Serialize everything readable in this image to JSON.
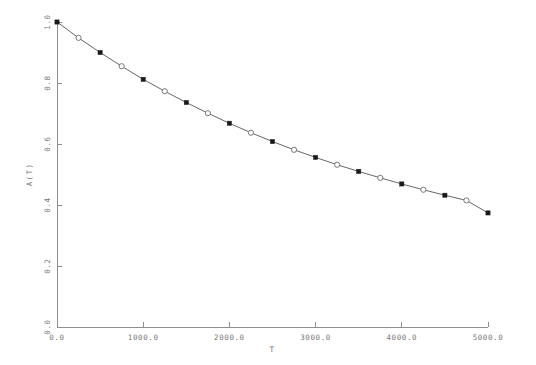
{
  "chart_data": {
    "type": "line",
    "title": "",
    "xlabel": "T",
    "ylabel": "A(T)",
    "xlim": [
      0.0,
      5000.0
    ],
    "ylim": [
      0.0,
      1.0
    ],
    "grid": false,
    "legend": null,
    "xticks": [
      0.0,
      1000.0,
      2000.0,
      3000.0,
      4000.0,
      5000.0
    ],
    "xticklabels": [
      "0.0",
      "1000.0",
      "2000.0",
      "3000.0",
      "4000.0",
      "5000.0"
    ],
    "yticks": [
      0.0,
      0.2,
      0.4,
      0.6,
      0.8,
      1.0
    ],
    "yticklabels": [
      "0.0",
      "0.2",
      "0.4",
      "0.6",
      "0.8",
      "1.0"
    ],
    "series": [
      {
        "name": "A(T)",
        "marker": "alternating-filled-square-open-circle",
        "line": "solid",
        "x": [
          0,
          250,
          500,
          750,
          1000,
          1250,
          1500,
          1750,
          2000,
          2250,
          2500,
          2750,
          3000,
          3250,
          3500,
          3750,
          4000,
          4250,
          4500,
          4750,
          5000
        ],
        "y": [
          1.0,
          0.948,
          0.9,
          0.855,
          0.812,
          0.773,
          0.736,
          0.701,
          0.668,
          0.637,
          0.608,
          0.581,
          0.556,
          0.532,
          0.51,
          0.489,
          0.469,
          0.45,
          0.432,
          0.415,
          0.374
        ]
      }
    ]
  }
}
